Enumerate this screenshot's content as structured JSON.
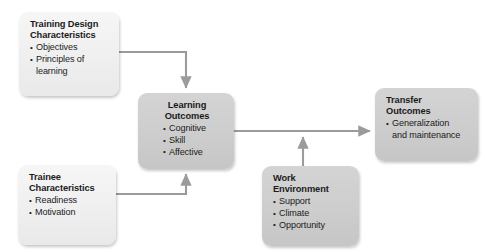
{
  "diagram": {
    "colors": {
      "light_box": "#f0f0f0",
      "dark_box": "#cdcdcd",
      "connector": "#9b9b9b",
      "text": "#1b1b1b"
    },
    "nodes": [
      {
        "id": "training-design",
        "title": "Training Design\nCharacteristics",
        "shade": "light",
        "align": "left",
        "bullets": [
          "Objectives",
          "Principles of",
          "learning"
        ]
      },
      {
        "id": "trainee-characteristics",
        "title": "Trainee\nCharacteristics",
        "shade": "light",
        "align": "left",
        "bullets": [
          "Readiness",
          "Motivation"
        ]
      },
      {
        "id": "learning-outcomes",
        "title": "Learning\nOutcomes",
        "shade": "dark",
        "align": "center",
        "bullets": [
          "Cognitive",
          "Skill",
          "Affective"
        ]
      },
      {
        "id": "work-environment",
        "title": "Work\nEnvironment",
        "shade": "dark",
        "align": "left",
        "bullets": [
          "Support",
          "Climate",
          "Opportunity"
        ]
      },
      {
        "id": "transfer-outcomes",
        "title": "Transfer\nOutcomes",
        "shade": "dark",
        "align": "left",
        "bullets": [
          "Generalization",
          "and maintenance"
        ]
      }
    ],
    "connectors": [
      {
        "id": "training-to-learning",
        "from": "training-design",
        "to": "learning-outcomes"
      },
      {
        "id": "trainee-to-learning",
        "from": "trainee-characteristics",
        "to": "learning-outcomes"
      },
      {
        "id": "learning-to-transfer",
        "from": "learning-outcomes",
        "to": "transfer-outcomes"
      },
      {
        "id": "work-to-transfer-link",
        "from": "work-environment",
        "to": "learning-to-transfer"
      }
    ]
  },
  "nodes": {
    "training": {
      "title": "Training Design\nCharacteristics",
      "b0": "Objectives",
      "b1": "Principles of",
      "b2": "learning"
    },
    "trainee": {
      "title": "Trainee\nCharacteristics",
      "b0": "Readiness",
      "b1": "Motivation"
    },
    "learning": {
      "title": "Learning\nOutcomes",
      "b0": "Cognitive",
      "b1": "Skill",
      "b2": "Affective"
    },
    "work": {
      "title": "Work\nEnvironment",
      "b0": "Support",
      "b1": "Climate",
      "b2": "Opportunity"
    },
    "transfer": {
      "title": "Transfer\nOutcomes",
      "b0": "Generalization",
      "b1": "and maintenance"
    }
  }
}
